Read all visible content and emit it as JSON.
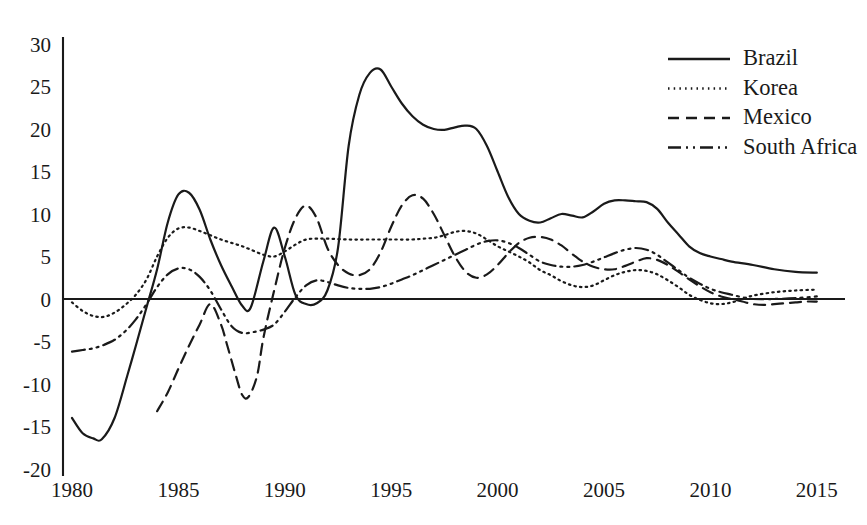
{
  "chart_data": {
    "type": "line",
    "title": "",
    "subtitle": "",
    "xlabel": "",
    "ylabel": "",
    "xlim": [
      1980,
      2015.6
    ],
    "ylim": [
      -20,
      30
    ],
    "grid": false,
    "legend_position": "top-right",
    "x_ticks": [
      "1980",
      "1985",
      "1990",
      "1995",
      "2000",
      "2005",
      "2010",
      "2015"
    ],
    "x_tick_values": [
      1980,
      1985,
      1990,
      1995,
      2000,
      2005,
      2010,
      2015
    ],
    "y_ticks": [
      "30",
      "25",
      "20",
      "15",
      "10",
      "5",
      "0",
      "-5",
      "-10",
      "-15",
      "-20"
    ],
    "y_tick_values": [
      30,
      25,
      20,
      15,
      10,
      5,
      0,
      -5,
      -10,
      -15,
      -20
    ],
    "zero_reference_line": 0,
    "series": [
      {
        "name": "Brazil",
        "style": "solid",
        "dasharray": "none",
        "color": "#1a1a1a",
        "x": [
          1980,
          1980.5,
          1981,
          1981.4,
          1982,
          1982.6,
          1983,
          1983.5,
          1984,
          1984.5,
          1985,
          1985.5,
          1986,
          1986.5,
          1987,
          1987.5,
          1988,
          1988.4,
          1989,
          1989.5,
          1990,
          1990.5,
          1991,
          1991.5,
          1992,
          1992.5,
          1993,
          1993.5,
          1994,
          1994.5,
          1995,
          1995.5,
          1996,
          1996.5,
          1997,
          1997.5,
          1998,
          1998.5,
          1999,
          1999.5,
          2000,
          2000.5,
          2001,
          2001.5,
          2002,
          2002.5,
          2003,
          2003.5,
          2004,
          2004.5,
          2005,
          2005.5,
          2006,
          2006.5,
          2007,
          2007.5,
          2008,
          2008.5,
          2009,
          2009.5,
          2010,
          2010.5,
          2011,
          2012,
          2013,
          2014,
          2015
        ],
        "y": [
          -14.0,
          -15.8,
          -16.4,
          -16.5,
          -14.0,
          -9.0,
          -5.5,
          -1.0,
          3.5,
          9.0,
          12.3,
          12.5,
          10.5,
          7.0,
          4.0,
          1.5,
          -0.8,
          -1.0,
          4.5,
          8.4,
          5.0,
          0.5,
          -0.6,
          -0.5,
          1.0,
          6.0,
          18.0,
          24.0,
          26.6,
          27.0,
          25.0,
          23.0,
          21.5,
          20.5,
          20.0,
          19.9,
          20.2,
          20.4,
          20.0,
          18.0,
          15.0,
          12.0,
          10.0,
          9.2,
          9.0,
          9.5,
          10.0,
          9.8,
          9.6,
          10.3,
          11.2,
          11.6,
          11.6,
          11.5,
          11.4,
          10.6,
          9.0,
          7.6,
          6.2,
          5.4,
          5.0,
          4.7,
          4.4,
          4.0,
          3.5,
          3.2,
          3.1
        ]
      },
      {
        "name": "Korea",
        "style": "dotted",
        "dasharray": "1.5 4.2",
        "color": "#1a1a1a",
        "x": [
          1980,
          1980.5,
          1981,
          1981.5,
          1982,
          1982.5,
          1983,
          1983.5,
          1984,
          1984.5,
          1985,
          1985.5,
          1986,
          1986.5,
          1987,
          1987.5,
          1988,
          1988.5,
          1989,
          1989.5,
          1990,
          1990.5,
          1991,
          1991.5,
          1992,
          1993,
          1994,
          1995,
          1996,
          1996.5,
          1997,
          1997.5,
          1998,
          1998.5,
          1999,
          1999.5,
          2000,
          2000.5,
          2001,
          2001.5,
          2002,
          2002.5,
          2003,
          2003.5,
          2004,
          2004.5,
          2005,
          2005.5,
          2006,
          2006.5,
          2007,
          2007.5,
          2008,
          2008.5,
          2009,
          2009.5,
          2010,
          2010.5,
          2011,
          2011.5,
          2012,
          2013,
          2014,
          2015
        ],
        "y": [
          -0.4,
          -1.4,
          -2.0,
          -2.1,
          -1.6,
          -0.7,
          0.5,
          2.3,
          5.0,
          7.2,
          8.3,
          8.4,
          8.0,
          7.5,
          7.0,
          6.6,
          6.2,
          5.7,
          5.2,
          5.0,
          5.6,
          6.4,
          7.0,
          7.1,
          7.1,
          7.0,
          7.0,
          7.0,
          7.0,
          7.1,
          7.2,
          7.5,
          7.9,
          8.0,
          7.7,
          7.0,
          6.2,
          5.6,
          5.0,
          4.3,
          3.4,
          2.8,
          2.1,
          1.6,
          1.4,
          1.6,
          2.2,
          2.8,
          3.2,
          3.4,
          3.3,
          2.9,
          2.2,
          1.4,
          0.5,
          -0.1,
          -0.5,
          -0.6,
          -0.4,
          0.0,
          0.4,
          0.8,
          1.0,
          1.1
        ]
      },
      {
        "name": "Mexico",
        "style": "dashed",
        "dasharray": "11 7",
        "color": "#1a1a1a",
        "x": [
          1984,
          1984.5,
          1985,
          1985.5,
          1986,
          1986.5,
          1987,
          1987.3,
          1987.7,
          1988,
          1988.3,
          1988.7,
          1989,
          1989.5,
          1990,
          1990.5,
          1991,
          1991.5,
          1992,
          1992.5,
          1993,
          1993.5,
          1994,
          1994.5,
          1995,
          1995.5,
          1996,
          1996.5,
          1997,
          1997.5,
          1998,
          1998.5,
          1999,
          1999.5,
          2000,
          2000.5,
          2001,
          2001.5,
          2002,
          2002.5,
          2003,
          2003.5,
          2004,
          2004.5,
          2005,
          2005.5,
          2006,
          2006.5,
          2007,
          2007.5,
          2008,
          2008.5,
          2009,
          2009.5,
          2010,
          2010.5,
          2011,
          2011.5,
          2012,
          2012.5,
          2013,
          2013.5,
          2014,
          2014.5,
          2015
        ],
        "y": [
          -13.2,
          -11.0,
          -8.2,
          -5.5,
          -3.0,
          -0.6,
          -3.0,
          -5.5,
          -9.0,
          -11.3,
          -11.5,
          -9.0,
          -4.5,
          1.0,
          6.0,
          9.5,
          11.0,
          9.5,
          6.0,
          4.0,
          3.0,
          2.8,
          3.5,
          5.5,
          8.5,
          11.0,
          12.2,
          11.8,
          10.0,
          7.5,
          5.0,
          3.2,
          2.5,
          2.9,
          4.0,
          5.4,
          6.6,
          7.2,
          7.3,
          7.0,
          6.3,
          5.3,
          4.4,
          3.8,
          3.5,
          3.5,
          3.9,
          4.4,
          4.8,
          4.6,
          4.0,
          3.2,
          2.3,
          1.5,
          0.8,
          0.3,
          0.0,
          -0.3,
          -0.6,
          -0.7,
          -0.6,
          -0.5,
          -0.4,
          -0.3,
          -0.3
        ]
      },
      {
        "name": "South Africa",
        "style": "dashdotdot",
        "dasharray": "13 5 2 5 2 5",
        "color": "#1a1a1a",
        "x": [
          1980,
          1980.5,
          1981,
          1981.5,
          1982,
          1982.5,
          1983,
          1983.5,
          1984,
          1984.5,
          1985,
          1985.5,
          1986,
          1986.5,
          1987,
          1987.5,
          1988,
          1988.5,
          1989,
          1989.5,
          1990,
          1990.5,
          1991,
          1991.5,
          1992,
          1992.5,
          1993,
          1993.5,
          1994,
          1994.5,
          1995,
          1995.5,
          1996,
          1996.5,
          1997,
          1997.5,
          1998,
          1998.5,
          1999,
          1999.5,
          2000,
          2000.5,
          2001,
          2001.5,
          2002,
          2002.5,
          2003,
          2003.5,
          2004,
          2004.5,
          2005,
          2005.5,
          2006,
          2006.5,
          2007,
          2007.5,
          2008,
          2008.5,
          2009,
          2009.5,
          2010,
          2010.5,
          2011,
          2011.5,
          2012,
          2013,
          2014,
          2015
        ],
        "y": [
          -6.2,
          -6.0,
          -5.8,
          -5.4,
          -4.8,
          -3.8,
          -2.4,
          -0.6,
          1.4,
          2.9,
          3.6,
          3.5,
          2.6,
          1.0,
          -1.2,
          -3.2,
          -4.0,
          -3.9,
          -3.6,
          -3.0,
          -1.5,
          0.2,
          1.6,
          2.2,
          2.0,
          1.6,
          1.3,
          1.2,
          1.2,
          1.4,
          1.8,
          2.3,
          2.8,
          3.4,
          4.0,
          4.6,
          5.2,
          5.8,
          6.4,
          6.8,
          6.9,
          6.6,
          6.0,
          5.2,
          4.4,
          4.0,
          3.8,
          3.8,
          4.0,
          4.4,
          4.9,
          5.4,
          5.8,
          6.0,
          5.8,
          5.2,
          4.3,
          3.4,
          2.5,
          1.8,
          1.2,
          0.8,
          0.5,
          0.2,
          0.0,
          0.0,
          0.1,
          0.3
        ]
      }
    ]
  },
  "legend": {
    "items": [
      {
        "label": "Brazil"
      },
      {
        "label": "Korea"
      },
      {
        "label": "Mexico"
      },
      {
        "label": "South Africa"
      }
    ]
  }
}
